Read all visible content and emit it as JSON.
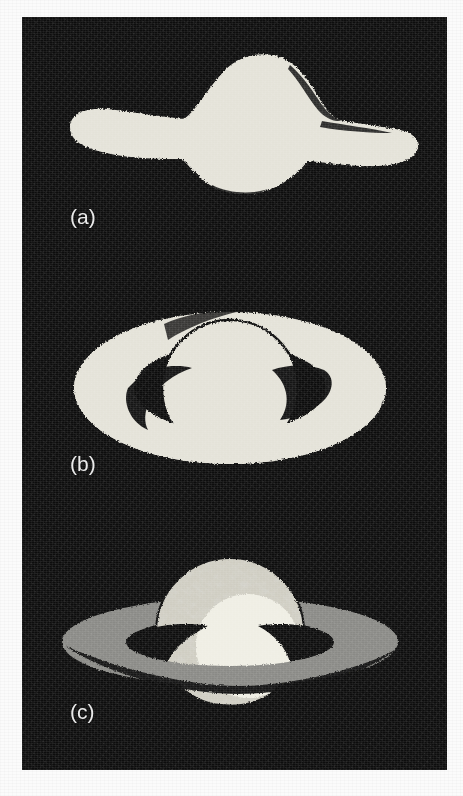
{
  "figure": {
    "background_color": "#0d0d0d",
    "page_color": "#fbfbfb",
    "plate": {
      "x": 22,
      "y": 17,
      "width": 425,
      "height": 753
    },
    "panels": [
      {
        "id": "a",
        "label": "(a)",
        "caption": "Rings seen edge-on, nearly zero opening angle",
        "body_color": "#e4e2d8",
        "ring_color": "#e4e2d8",
        "ring_opening_deg": 0,
        "label_position": {
          "x": 48,
          "y": 188
        }
      },
      {
        "id": "b",
        "label": "(b)",
        "caption": "Rings wide open, maximum tilt toward observer",
        "body_color": "#e4e2d8",
        "ring_color": "#e4e2d8",
        "shadow_color": "#0d0d0d",
        "ring_opening_deg": 27,
        "label_position": {
          "x": 48,
          "y": 182
        }
      },
      {
        "id": "c",
        "label": "(c)",
        "caption": "Rings at intermediate tilt, globe banded and shadowed",
        "body_color": "#cfcdc2",
        "body_highlight_color": "#efeee4",
        "body_texture_color": "#a8a69a",
        "ring_color": "#8a8a86",
        "shadow_color": "#0d0d0d",
        "ring_opening_deg": 14,
        "label_position": {
          "x": 48,
          "y": 180
        }
      }
    ]
  },
  "chart_data": {
    "type": "diagram",
    "categories": [
      "(a)",
      "(b)",
      "(c)"
    ],
    "annotations": [
      "(a)",
      "(b)",
      "(c)"
    ],
    "series": [
      {
        "name": "ring_opening_angle_deg",
        "values": [
          0,
          27,
          14
        ]
      }
    ],
    "legend_position": "none",
    "grid": false
  }
}
